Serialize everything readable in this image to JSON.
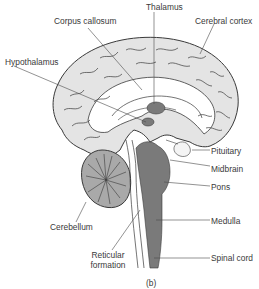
{
  "figure": {
    "panel_label": "(b)",
    "colors": {
      "cortex_fill": "#e4e4e4",
      "dark_structure": "#7a7a7a",
      "cerebellum_fill": "#a9a9a9",
      "outline": "#3a3a3a",
      "leader_line": "#4a4a4a"
    }
  },
  "labels": {
    "thalamus": "Thalamus",
    "corpus_callosum": "Corpus callosum",
    "cerebral_cortex": "Cerebral cortex",
    "hypothalamus": "Hypothalamus",
    "pituitary": "Pituitary",
    "midbrain": "Midbrain",
    "pons": "Pons",
    "cerebellum": "Cerebellum",
    "medulla": "Medulla",
    "reticular_formation_line1": "Reticular",
    "reticular_formation_line2": "formation",
    "spinal_cord": "Spinal cord"
  }
}
